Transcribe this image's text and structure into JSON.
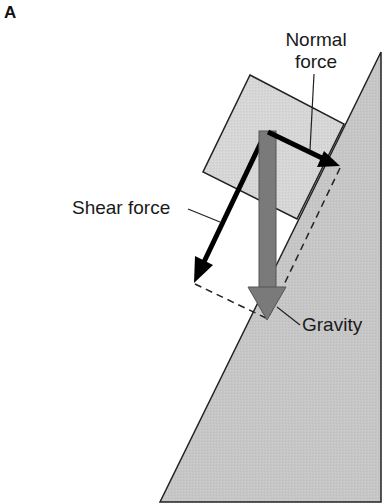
{
  "figure": {
    "panel_label": "A",
    "labels": {
      "normal_force_line1": "Normal",
      "normal_force_line2": "force",
      "shear_force": "Shear force",
      "gravity": "Gravity"
    },
    "colors": {
      "background": "#ffffff",
      "slope_fill": "#c4c4c4",
      "block_fill": "#d4d4d4",
      "gravity_arrow": "#7a7a7a",
      "force_arrows": "#000000",
      "outline": "#222222"
    },
    "geometry": {
      "slope": [
        [
          160,
          502
        ],
        [
          381,
          502
        ],
        [
          381,
          52
        ]
      ],
      "block": [
        [
          250,
          75
        ],
        [
          344,
          124
        ],
        [
          297,
          219
        ],
        [
          203,
          172
        ]
      ],
      "gravity_arrow": {
        "from": [
          267,
          131
        ],
        "to": [
          267,
          320
        ]
      },
      "normal_arrow": {
        "from": [
          267,
          131
        ],
        "to": [
          340,
          166
        ]
      },
      "shear_arrow": {
        "from": [
          267,
          131
        ],
        "to": [
          194,
          283
        ]
      },
      "dashed_lines": [
        {
          "from": [
            340,
            166
          ],
          "to": [
            267,
            320
          ]
        },
        {
          "from": [
            194,
            283
          ],
          "to": [
            267,
            320
          ]
        }
      ]
    }
  }
}
